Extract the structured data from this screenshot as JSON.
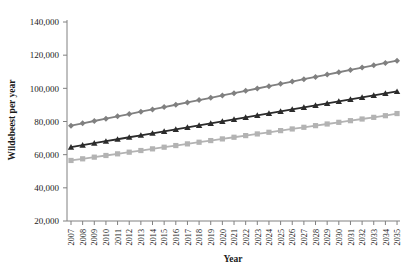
{
  "chart_data": {
    "type": "line",
    "title": "",
    "xlabel": "Year",
    "ylabel": "Wildebeest per year",
    "xlim": [
      2007,
      2035
    ],
    "ylim": [
      20000,
      140000
    ],
    "ytick_labels": [
      "20,000",
      "40,000",
      "60,000",
      "80,000",
      "100,000",
      "120,000",
      "140,000"
    ],
    "ytick_values": [
      20000,
      40000,
      60000,
      80000,
      100000,
      120000,
      140000
    ],
    "grid": false,
    "legend": "none",
    "categories": [
      2007,
      2008,
      2009,
      2010,
      2011,
      2012,
      2013,
      2014,
      2015,
      2016,
      2017,
      2018,
      2019,
      2020,
      2021,
      2022,
      2023,
      2024,
      2025,
      2026,
      2027,
      2028,
      2029,
      2030,
      2031,
      2032,
      2033,
      2034,
      2035
    ],
    "xtick_labels": [
      "2007",
      "2008",
      "2009",
      "2010",
      "2011",
      "2012",
      "2013",
      "2014",
      "2015",
      "2016",
      "2017",
      "2018",
      "2019",
      "2020",
      "2021",
      "2022",
      "2023",
      "2024",
      "2025",
      "2026",
      "2027",
      "2028",
      "2029",
      "2030",
      "2031",
      "2032",
      "2033",
      "2034",
      "2035"
    ],
    "series": [
      {
        "name": "Upper scenario",
        "marker": "diamond",
        "color": "#808080",
        "values": [
          77500,
          78900,
          80300,
          81700,
          83100,
          84500,
          85900,
          87300,
          88700,
          90100,
          91500,
          92900,
          94300,
          95700,
          97100,
          98500,
          99900,
          101300,
          102700,
          104100,
          105500,
          106900,
          108300,
          109700,
          111100,
          112500,
          113900,
          115300,
          116700
        ]
      },
      {
        "name": "Middle scenario",
        "marker": "triangle",
        "color": "#2b2b2b",
        "values": [
          64500,
          65700,
          66900,
          68100,
          69300,
          70500,
          71700,
          72900,
          74100,
          75300,
          76500,
          77700,
          78900,
          80100,
          81300,
          82500,
          83700,
          84900,
          86100,
          87300,
          88500,
          89700,
          90900,
          92100,
          93300,
          94500,
          95700,
          96900,
          98100
        ]
      },
      {
        "name": "Lower scenario",
        "marker": "square",
        "color": "#b3b3b3",
        "values": [
          56500,
          57500,
          58500,
          59500,
          60500,
          61500,
          62500,
          63500,
          64500,
          65500,
          66500,
          67500,
          68500,
          69500,
          70500,
          71500,
          72500,
          73500,
          74500,
          75500,
          76500,
          77500,
          78500,
          79500,
          80500,
          81500,
          82500,
          83500,
          84800
        ]
      }
    ]
  },
  "axis": {
    "line_color": "#808080"
  }
}
